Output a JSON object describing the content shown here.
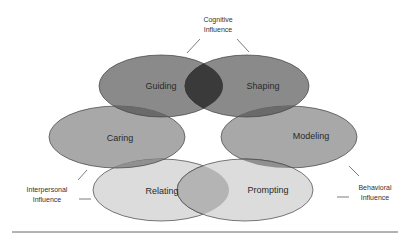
{
  "diagram": {
    "ellipses": [
      {
        "id": "guiding",
        "label": "Guiding",
        "color": "#8a8a8a"
      },
      {
        "id": "shaping",
        "label": "Shaping",
        "color": "#8a8a8a"
      },
      {
        "id": "caring",
        "label": "Caring",
        "color": "#a8a8a8"
      },
      {
        "id": "modeling",
        "label": "Modeling",
        "color": "#a8a8a8"
      },
      {
        "id": "relating",
        "label": "Relating",
        "color": "#dcdcdc"
      },
      {
        "id": "prompting",
        "label": "Prompting",
        "color": "#dcdcdc"
      }
    ],
    "annotations": {
      "cognitive": {
        "line1": "Cognitive",
        "line2": "Influence"
      },
      "interpersonal": {
        "line1": "Interpersonal",
        "line2": "Influence"
      },
      "behavioral": {
        "line1": "Behavioral",
        "line2": "Influence"
      }
    }
  }
}
